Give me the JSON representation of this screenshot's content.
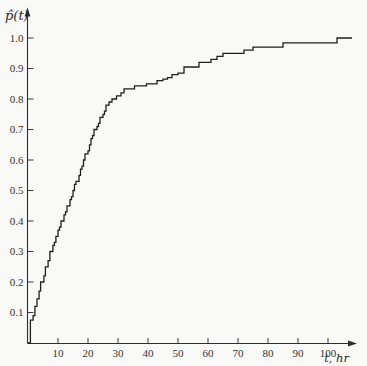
{
  "figure": {
    "background": "#f9f9f7",
    "ink_color": "#1f1f1f",
    "axis_color": "#2e2e2e"
  },
  "chart_data": {
    "type": "line",
    "subtype": "empirical-cdf-step-function",
    "title": "",
    "ylabel": "p̂(t)",
    "xlabel": "t, hr",
    "x_ticks": [
      10,
      20,
      30,
      40,
      50,
      60,
      70,
      80,
      90,
      100
    ],
    "y_ticks": [
      0.1,
      0.2,
      0.3,
      0.4,
      0.5,
      0.6,
      0.7,
      0.8,
      0.9,
      1.0
    ],
    "xlim": [
      0,
      110
    ],
    "ylim": [
      0,
      1.08
    ],
    "grid": false,
    "legend": false,
    "series": [
      {
        "name": "empirical probability p-hat(t)",
        "start": [
          0,
          0
        ],
        "end_t": 108,
        "steps": [
          [
            0.8,
            0.075
          ],
          [
            1.7,
            0.09
          ],
          [
            2.3,
            0.12
          ],
          [
            3,
            0.145
          ],
          [
            3.7,
            0.17
          ],
          [
            4.2,
            0.2
          ],
          [
            5.3,
            0.22
          ],
          [
            5.8,
            0.25
          ],
          [
            6.7,
            0.27
          ],
          [
            7.3,
            0.3
          ],
          [
            8.3,
            0.32
          ],
          [
            8.8,
            0.33
          ],
          [
            9.3,
            0.35
          ],
          [
            10,
            0.37
          ],
          [
            10.5,
            0.38
          ],
          [
            11,
            0.4
          ],
          [
            12,
            0.42
          ],
          [
            12.5,
            0.43
          ],
          [
            13,
            0.45
          ],
          [
            14,
            0.47
          ],
          [
            14.5,
            0.48
          ],
          [
            15,
            0.5
          ],
          [
            15.5,
            0.52
          ],
          [
            16,
            0.53
          ],
          [
            17,
            0.55
          ],
          [
            17.5,
            0.57
          ],
          [
            18,
            0.58
          ],
          [
            18.5,
            0.6
          ],
          [
            19,
            0.62
          ],
          [
            20,
            0.63
          ],
          [
            20.5,
            0.65
          ],
          [
            21,
            0.67
          ],
          [
            21.5,
            0.68
          ],
          [
            22,
            0.7
          ],
          [
            23,
            0.71
          ],
          [
            23.5,
            0.72
          ],
          [
            24,
            0.74
          ],
          [
            25,
            0.75
          ],
          [
            25.5,
            0.76
          ],
          [
            26,
            0.78
          ],
          [
            27,
            0.79
          ],
          [
            28,
            0.8
          ],
          [
            29.5,
            0.81
          ],
          [
            31,
            0.82
          ],
          [
            32,
            0.833
          ],
          [
            35.5,
            0.843
          ],
          [
            39.5,
            0.85
          ],
          [
            43,
            0.86
          ],
          [
            45,
            0.865
          ],
          [
            46.5,
            0.87
          ],
          [
            48,
            0.88
          ],
          [
            50,
            0.885
          ],
          [
            52,
            0.905
          ],
          [
            57,
            0.92
          ],
          [
            61,
            0.93
          ],
          [
            63,
            0.94
          ],
          [
            65,
            0.95
          ],
          [
            72,
            0.96
          ],
          [
            75,
            0.97
          ],
          [
            85,
            0.984
          ],
          [
            103,
            1.0
          ]
        ]
      }
    ]
  }
}
